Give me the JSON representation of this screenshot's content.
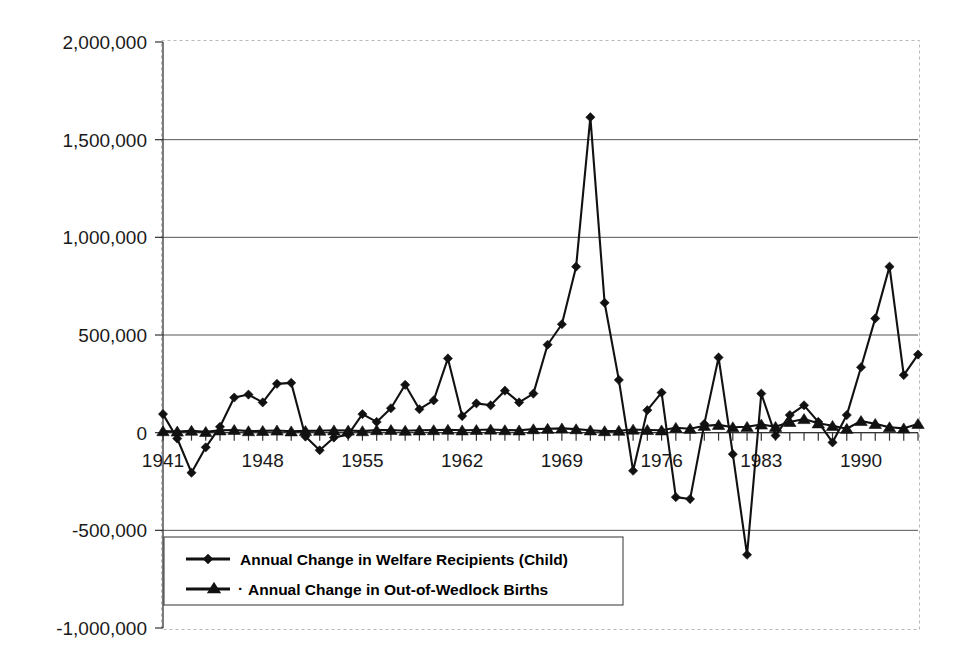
{
  "chart_data": {
    "type": "line",
    "title": "",
    "subtitle": "",
    "xlabel": "",
    "ylabel": "",
    "grid": true,
    "legend_position": "inside-bottom-left",
    "ylim": [
      -1000000,
      2000000
    ],
    "ytick_labels": [
      "2,000,000",
      "1,500,000",
      "1,000,000",
      "500,000",
      "0",
      "-500,000",
      "-1,000,000"
    ],
    "ytick_values": [
      2000000,
      1500000,
      1000000,
      500000,
      0,
      -500000,
      -1000000
    ],
    "xlim": [
      1941,
      1994
    ],
    "xtick_labels": [
      "1941",
      "1948",
      "1955",
      "1962",
      "1969",
      "1976",
      "1983",
      "1990"
    ],
    "xtick_values": [
      1941,
      1948,
      1955,
      1962,
      1969,
      1976,
      1983,
      1990
    ],
    "x": [
      1941,
      1942,
      1943,
      1944,
      1945,
      1946,
      1947,
      1948,
      1949,
      1950,
      1951,
      1952,
      1953,
      1954,
      1955,
      1956,
      1957,
      1958,
      1959,
      1960,
      1961,
      1962,
      1963,
      1964,
      1965,
      1966,
      1967,
      1968,
      1969,
      1970,
      1971,
      1972,
      1973,
      1974,
      1975,
      1976,
      1977,
      1978,
      1979,
      1980,
      1981,
      1982,
      1983,
      1984,
      1985,
      1986,
      1987,
      1988,
      1989,
      1990,
      1991,
      1992,
      1993,
      1994
    ],
    "series": [
      {
        "name": "Annual Change in Welfare Recipients (Child)",
        "marker": "diamond",
        "color": "#111111",
        "values": [
          95000,
          -30000,
          -205000,
          -75000,
          30000,
          180000,
          195000,
          155000,
          250000,
          255000,
          -20000,
          -90000,
          -25000,
          -10000,
          95000,
          55000,
          125000,
          245000,
          120000,
          165000,
          380000,
          85000,
          150000,
          140000,
          215000,
          155000,
          200000,
          450000,
          555000,
          850000,
          1615000,
          665000,
          270000,
          -195000,
          115000,
          205000,
          -330000,
          -340000,
          45000,
          385000,
          -110000,
          -625000,
          200000,
          -15000,
          90000,
          140000,
          55000,
          -50000,
          90000,
          335000,
          585000,
          850000,
          295000,
          400000
        ]
      },
      {
        "name": "Annual Change in Out-of-Wedlock Births",
        "marker": "triangle",
        "color": "#111111",
        "values": [
          8000,
          6000,
          10000,
          4000,
          12000,
          14000,
          8000,
          9000,
          11000,
          7000,
          9000,
          10000,
          12000,
          11000,
          8000,
          13000,
          14000,
          10000,
          12000,
          13000,
          15000,
          12000,
          14000,
          16000,
          13000,
          12000,
          18000,
          20000,
          22000,
          18000,
          12000,
          8000,
          10000,
          16000,
          14000,
          12000,
          25000,
          20000,
          35000,
          40000,
          28000,
          30000,
          42000,
          30000,
          55000,
          70000,
          48000,
          35000,
          20000,
          60000,
          45000,
          28000,
          22000,
          45000
        ]
      }
    ]
  },
  "legend": {
    "entries": [
      {
        "label": "Annual Change in Welfare Recipients (Child)",
        "marker": "diamond"
      },
      {
        "label": "Annual Change in Out-of-Wedlock Births",
        "marker": "triangle"
      }
    ]
  }
}
